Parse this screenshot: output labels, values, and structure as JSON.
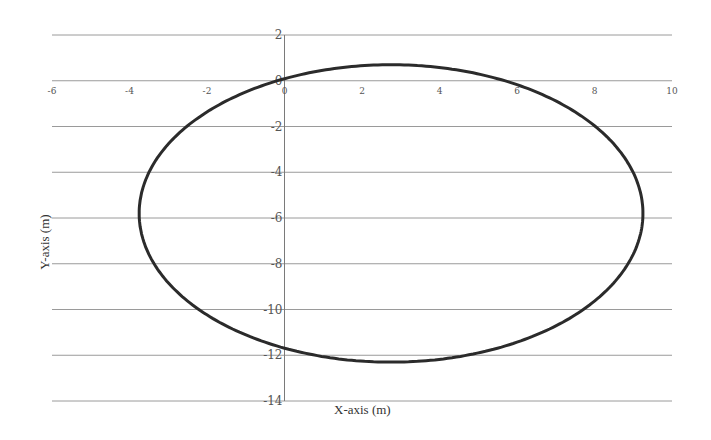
{
  "chart_data": {
    "type": "line",
    "title": "",
    "xlabel": "X-axis (m)",
    "ylabel": "Y-axis (m)",
    "xlim": [
      -6,
      10
    ],
    "ylim": [
      -14,
      2
    ],
    "x_ticks": [
      -6,
      -4,
      -2,
      0,
      2,
      4,
      6,
      8,
      10
    ],
    "x_tick_labels": [
      "-6",
      "-4",
      "-2",
      "0",
      "2",
      "4",
      "6",
      "8",
      "10"
    ],
    "y_ticks": [
      2,
      0,
      -2,
      -4,
      -6,
      -8,
      -10,
      -12,
      -14
    ],
    "y_tick_labels": [
      "2",
      "0",
      "-2",
      "-4",
      "-6",
      "-8",
      "-10",
      "-12",
      "-14"
    ],
    "grid": {
      "horizontal": true,
      "vertical": false
    },
    "legend": null,
    "series": [
      {
        "name": "trajectory",
        "shape": "ellipse",
        "center": [
          2.75,
          -5.8
        ],
        "semi_axis_x": 6.5,
        "semi_axis_y": 6.5,
        "x": [
          0,
          1,
          2,
          3,
          4,
          5,
          6,
          7,
          8,
          9,
          9.25,
          9,
          8,
          7,
          6,
          5,
          4,
          3,
          2,
          1,
          0,
          -1,
          -2,
          -3,
          -3.75,
          -3,
          -2,
          -1,
          0
        ],
        "y": [
          0,
          0.45,
          0.65,
          0.7,
          0.55,
          0.2,
          -0.4,
          -1.4,
          -2.9,
          -4.9,
          -5.8,
          -7.3,
          -9.2,
          -10.6,
          -11.5,
          -12.0,
          -12.25,
          -12.3,
          -12.25,
          -12.0,
          -11.7,
          -11.1,
          -10.3,
          -9.0,
          -5.8,
          -3.1,
          -1.6,
          -0.6,
          0
        ]
      }
    ],
    "colors": {
      "line": "#2b2b2b",
      "grid": "#9a9a9a",
      "axis": "#7a7a7a",
      "background": "#ffffff"
    }
  }
}
